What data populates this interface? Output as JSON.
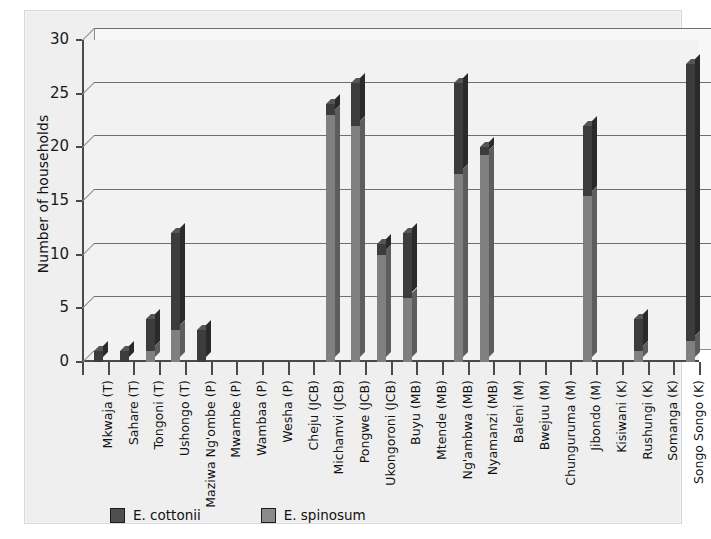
{
  "chart_data": {
    "type": "bar",
    "title": "",
    "subtitle": "",
    "xlabel": "",
    "ylabel": "Number of households",
    "ylim": [
      0,
      30
    ],
    "yticks": [
      0,
      5,
      10,
      15,
      20,
      25,
      30
    ],
    "grid": true,
    "stacked": true,
    "three_d": true,
    "legend_position": "bottom-left",
    "categories": [
      "Mkwaja (T)",
      "Sahare (T)",
      "Tongoni (T)",
      "Ushongo (T)",
      "Maziwa Ng'ombe (P)",
      "Mwambe (P)",
      "Wambaa (P)",
      "Wesha (P)",
      "Cheju (JCB)",
      "Michamvi (JCB)",
      "Pongwe (JCB)",
      "Ukongoroni (JCB)",
      "Buyu (MB)",
      "Mtende (MB)",
      "Ng'ambwa (MB)",
      "Nyamanzi (MB)",
      "Baleni (M)",
      "Bwejuu (M)",
      "Chunguruma (M)",
      "Jibondo (M)",
      "Kisiwani (K)",
      "Rushungi (K)",
      "Somanga (K)",
      "Songo Songo (K)"
    ],
    "series": [
      {
        "name": "E. spinosum",
        "color": "#808080",
        "values": [
          0,
          0,
          1,
          3,
          0,
          0,
          0,
          0,
          0,
          23,
          22,
          10,
          6,
          0,
          17.5,
          19.3,
          0,
          0,
          0,
          15.5,
          0,
          1,
          0,
          2
        ]
      },
      {
        "name": "E. cottonii",
        "color": "#3c3c3c",
        "values": [
          1,
          1,
          3,
          9,
          3,
          0,
          0,
          0,
          0,
          1,
          4,
          1,
          6,
          0,
          8.5,
          0.7,
          0,
          0,
          0,
          6.5,
          0,
          3,
          0,
          25.8
        ]
      }
    ],
    "totals": [
      1,
      1,
      4,
      12,
      3,
      0,
      0,
      0,
      0,
      24,
      26,
      11,
      12,
      0,
      26,
      20,
      0,
      0,
      0,
      22,
      0,
      4,
      0,
      27.8
    ]
  },
  "legend": {
    "items": [
      {
        "label": "E. cottonii",
        "color": "#4f4f4f",
        "swatch": "cottonii-swatch"
      },
      {
        "label": "E. spinosum",
        "color": "#8a8a8a",
        "swatch": "spinosum-swatch"
      }
    ]
  }
}
